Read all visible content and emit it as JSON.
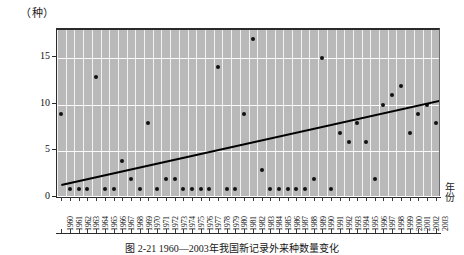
{
  "figure": {
    "caption": "图 2-21  1960—2003年我国新记录外来种数量变化",
    "y_unit_label": "（种）",
    "x_axis_title": "年份"
  },
  "chart_data": {
    "type": "scatter",
    "title": "",
    "subtitle": "",
    "xlabel": "年份",
    "ylabel": "（种）",
    "ylim": [
      0,
      18
    ],
    "xlim": [
      1960,
      2003
    ],
    "grid": true,
    "legend": null,
    "y_ticks": [
      0,
      5,
      10,
      15
    ],
    "x_ticks": [
      "1960",
      "1961",
      "1962",
      "1963",
      "1964",
      "1965",
      "1966",
      "1967",
      "1968",
      "1969",
      "1970",
      "1971",
      "1972",
      "1973",
      "1974",
      "1975",
      "1976",
      "1977",
      "1978",
      "1979",
      "1980",
      "1981",
      "1982",
      "1983",
      "1984",
      "1985",
      "1986",
      "1987",
      "1988",
      "1989",
      "1990",
      "1991",
      "1992",
      "1993",
      "1994",
      "1995",
      "1996",
      "1997",
      "1998",
      "1999",
      "2000",
      "2001",
      "2002",
      "2003"
    ],
    "x": [
      1960,
      1961,
      1962,
      1963,
      1964,
      1965,
      1966,
      1967,
      1968,
      1969,
      1970,
      1971,
      1972,
      1973,
      1974,
      1975,
      1976,
      1977,
      1978,
      1979,
      1980,
      1981,
      1982,
      1983,
      1984,
      1985,
      1986,
      1987,
      1988,
      1989,
      1990,
      1991,
      1992,
      1993,
      1994,
      1995,
      1996,
      1997,
      1998,
      1999,
      2000,
      2001,
      2002,
      2003
    ],
    "values": [
      9,
      1,
      1,
      1,
      13,
      1,
      1,
      4,
      2,
      1,
      8,
      1,
      2,
      2,
      1,
      1,
      1,
      1,
      14,
      1,
      1,
      9,
      17,
      3,
      1,
      1,
      1,
      1,
      1,
      2,
      15,
      1,
      7,
      6,
      8,
      6,
      2,
      10,
      11,
      12,
      7,
      9,
      10,
      8
    ],
    "series": [
      {
        "name": "新记录外来种数量",
        "marker": "filled-circle",
        "color": "#111111",
        "values": [
          9,
          1,
          1,
          1,
          13,
          1,
          1,
          4,
          2,
          1,
          8,
          1,
          2,
          2,
          1,
          1,
          1,
          1,
          14,
          1,
          1,
          9,
          17,
          3,
          1,
          1,
          1,
          1,
          1,
          2,
          15,
          1,
          7,
          6,
          8,
          6,
          2,
          10,
          11,
          12,
          7,
          9,
          10,
          8
        ]
      },
      {
        "name": "趋势线",
        "type": "trendline",
        "color": "#000000",
        "endpoints": [
          {
            "x": 1960,
            "y": 1.2
          },
          {
            "x": 2003,
            "y": 10.4
          }
        ]
      }
    ],
    "annotations": []
  },
  "colors": {
    "plot_background": "#b9b9b9",
    "gridline": "#f4f4f4",
    "point": "#111111",
    "trendline": "#000000",
    "axis": "#2b2b2b"
  }
}
